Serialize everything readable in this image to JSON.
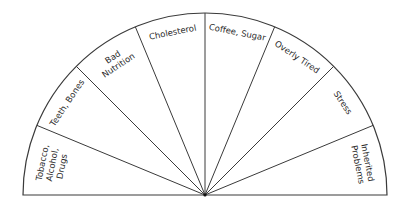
{
  "diagram": {
    "type": "semicircle-wheel",
    "center": [
      205,
      195
    ],
    "radius": 182,
    "line_color": "#3a3a3a",
    "segments": [
      {
        "lines": [
          "Tobacco,",
          "Alcohol,",
          "Drugs"
        ]
      },
      {
        "lines": [
          "Teeth, Bones"
        ]
      },
      {
        "lines": [
          "Bad",
          "Nutrition"
        ]
      },
      {
        "lines": [
          "Cholesterol"
        ]
      },
      {
        "lines": [
          "Coffee, Sugar"
        ]
      },
      {
        "lines": [
          "Overly Tired"
        ]
      },
      {
        "lines": [
          "Stress"
        ]
      },
      {
        "lines": [
          "Inherited",
          "Problems"
        ]
      }
    ]
  }
}
